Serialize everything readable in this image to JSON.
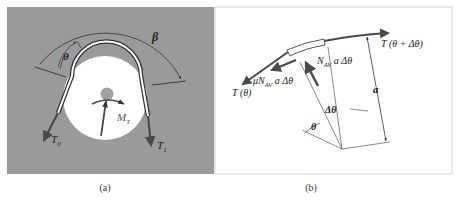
{
  "figure": {
    "panels": [
      {
        "id": "a",
        "caption": "(a)",
        "background": "#9a9a9a",
        "labels": {
          "beta": "β",
          "theta": "θ",
          "moment": "M",
          "moment_sub": "T",
          "tension_left": "T",
          "tension_left_sub": "0",
          "tension_right": "T",
          "tension_right_sub": "1"
        }
      },
      {
        "id": "b",
        "caption": "(b)",
        "background": "#ffffff",
        "labels": {
          "tension_left": "T (θ)",
          "tension_right": "T (θ + Δθ)",
          "friction": "μN",
          "friction_sub": "AV",
          "friction_tail": " a Δθ",
          "normal": "N",
          "normal_sub": "AV",
          "normal_tail": " a Δθ",
          "radius": "a",
          "delta_theta": "Δθ",
          "theta": "θ"
        }
      }
    ],
    "colors": {
      "panel_a_bg": "#9a9a9a",
      "arrow": "#4a4a4a",
      "line": "#333333",
      "pulley": "#ffffff"
    }
  }
}
